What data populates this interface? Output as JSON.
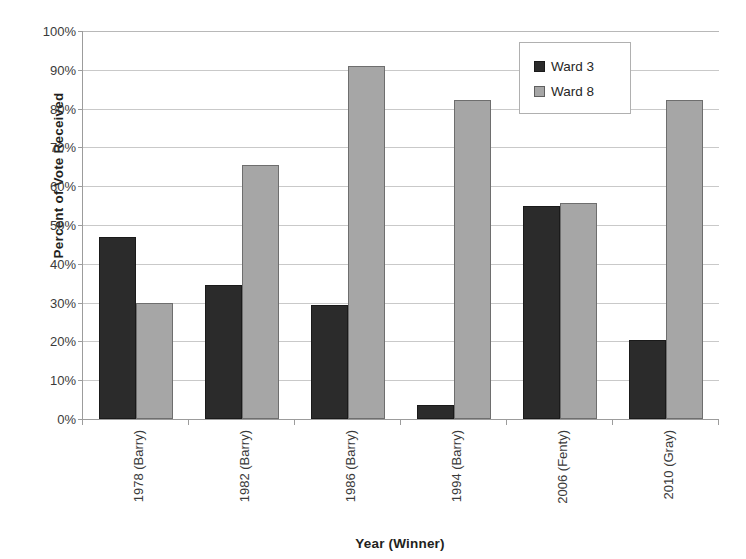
{
  "chart_data": {
    "type": "bar",
    "title": "",
    "xlabel": "Year (Winner)",
    "ylabel": "Percent of Vote Received",
    "categories": [
      "1978 (Barry)",
      "1982 (Barry)",
      "1986 (Barry)",
      "1994 (Barry)",
      "2006 (Fenty)",
      "2010 (Gray)"
    ],
    "series": [
      {
        "name": "Ward 3",
        "color": "#2b2b2b",
        "values": [
          47,
          34.5,
          29.5,
          3.5,
          54.8,
          20.3
        ]
      },
      {
        "name": "Ward 8",
        "color": "#a6a6a6",
        "values": [
          30,
          65.5,
          91,
          82.2,
          55.8,
          82.3
        ]
      }
    ],
    "ylim": [
      0,
      100
    ],
    "ytick_values": [
      0,
      10,
      20,
      30,
      40,
      50,
      60,
      70,
      80,
      90,
      100
    ],
    "ytick_labels": [
      "0%",
      "10%",
      "20%",
      "30%",
      "40%",
      "50%",
      "60%",
      "70%",
      "80%",
      "90%",
      "100%"
    ],
    "grid": true,
    "legend_position": "top-right"
  },
  "legend": {
    "items": [
      {
        "label": "Ward 3"
      },
      {
        "label": "Ward 8"
      }
    ]
  }
}
